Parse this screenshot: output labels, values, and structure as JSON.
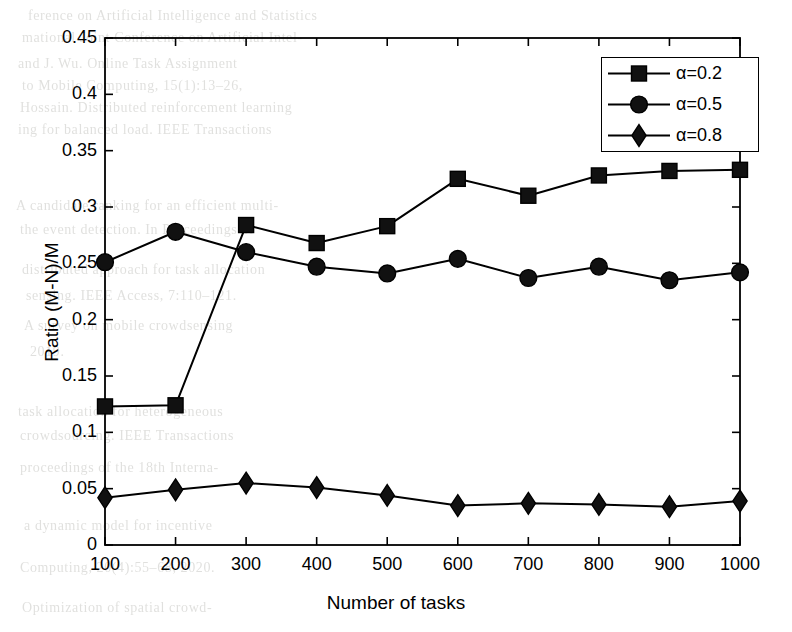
{
  "figure": {
    "background_text_lines": [
      {
        "text": "ference on Artificial Intelligence and Statistics",
        "x": 28,
        "y": 8
      },
      {
        "text": "mational Joint Conference on Artificial Intel-",
        "x": 22,
        "y": 30
      },
      {
        "text": "and J. Wu.   Online Task Assignment",
        "x": 18,
        "y": 56
      },
      {
        "text": "to Mobile Computing, 15(1):13–26,",
        "x": 22,
        "y": 78
      },
      {
        "text": "Hossain.   Distributed reinforcement learning",
        "x": 20,
        "y": 100
      },
      {
        "text": "ing for balanced load.  IEEE Transactions",
        "x": 18,
        "y": 122
      },
      {
        "text": "A candidate ranking for an efficient multi-",
        "x": 16,
        "y": 198
      },
      {
        "text": "the event detection.  In Proceedings of",
        "x": 20,
        "y": 222
      },
      {
        "text": "distributed approach for task allocation",
        "x": 22,
        "y": 262
      },
      {
        "text": "sensing. IEEE Access, 7:110–121.",
        "x": 26,
        "y": 288
      },
      {
        "text": "A survey on mobile crowdsensing",
        "x": 24,
        "y": 318
      },
      {
        "text": "2019.",
        "x": 30,
        "y": 344
      },
      {
        "text": "task allocation for heterogeneous",
        "x": 18,
        "y": 404
      },
      {
        "text": "crowdsourcing.  IEEE Transactions",
        "x": 20,
        "y": 428
      },
      {
        "text": "proceedings of the 18th Interna-",
        "x": 20,
        "y": 460
      },
      {
        "text": "a dynamic model for incentive",
        "x": 24,
        "y": 518
      },
      {
        "text": "Computing, 20(4):55–68, 2020.",
        "x": 20,
        "y": 560
      },
      {
        "text": "Optimization of spatial crowd-",
        "x": 22,
        "y": 600
      }
    ]
  },
  "axes": {
    "xlabel": "Number of tasks",
    "ylabel": "Ratio (M-N)/M",
    "xticks": [
      "100",
      "200",
      "300",
      "400",
      "500",
      "600",
      "700",
      "800",
      "900",
      "1000"
    ],
    "yticks": [
      "0",
      "0.05",
      "0.1",
      "0.15",
      "0.2",
      "0.25",
      "0.3",
      "0.35",
      "0.4",
      "0.45"
    ],
    "line_color": "#000000",
    "box_on": true
  },
  "legend": {
    "position": "top-right",
    "entries": [
      {
        "label": "α=0.2",
        "marker": "square"
      },
      {
        "label": "α=0.5",
        "marker": "circle"
      },
      {
        "label": "α=0.8",
        "marker": "diamond"
      }
    ]
  },
  "chart_data": {
    "type": "line",
    "title": "",
    "xlabel": "Number of tasks",
    "ylabel": "Ratio (M-N)/M",
    "x": [
      100,
      200,
      300,
      400,
      500,
      600,
      700,
      800,
      900,
      1000
    ],
    "xlim": [
      100,
      1000
    ],
    "ylim": [
      0,
      0.45
    ],
    "yticks": [
      0,
      0.05,
      0.1,
      0.15,
      0.2,
      0.25,
      0.3,
      0.35,
      0.4,
      0.45
    ],
    "xticks": [
      100,
      200,
      300,
      400,
      500,
      600,
      700,
      800,
      900,
      1000
    ],
    "grid": false,
    "legend_position": "upper right",
    "series": [
      {
        "name": "α=0.2",
        "marker": "square",
        "color": "#000000",
        "values": [
          0.123,
          0.124,
          0.284,
          0.268,
          0.283,
          0.325,
          0.31,
          0.328,
          0.332,
          0.333
        ]
      },
      {
        "name": "α=0.5",
        "marker": "circle",
        "color": "#000000",
        "values": [
          0.251,
          0.278,
          0.26,
          0.247,
          0.241,
          0.254,
          0.237,
          0.247,
          0.235,
          0.242
        ]
      },
      {
        "name": "α=0.8",
        "marker": "diamond",
        "color": "#000000",
        "values": [
          0.042,
          0.049,
          0.055,
          0.051,
          0.044,
          0.035,
          0.037,
          0.036,
          0.034,
          0.039
        ]
      }
    ]
  }
}
